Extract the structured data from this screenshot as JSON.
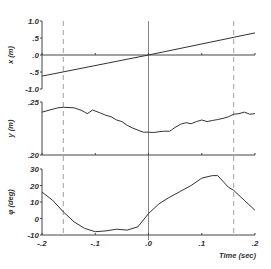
{
  "chart_data": {
    "type": "line",
    "title": "",
    "layout": {
      "panels_stacked_vertically": 3,
      "shared_x_axis": true,
      "grid": false,
      "legend": "none"
    },
    "xlabel": "Time (sec)",
    "xlim": [
      -0.2,
      0.2
    ],
    "x_tick_labels": [
      "-.2",
      "-.1",
      ".0",
      ".1",
      ".2"
    ],
    "x_ticks": [
      -0.2,
      -0.1,
      0.0,
      0.1,
      0.2
    ],
    "reference_lines": {
      "solid_vertical_at": 0.0,
      "dashed_vertical_at": [
        -0.16,
        0.16
      ]
    },
    "panels": [
      {
        "ylabel": "x (m)",
        "ylim": [
          -1.0,
          1.0
        ],
        "y_ticks": [
          1.0,
          0.5,
          0.0,
          -0.5,
          -1.0
        ],
        "y_tick_labels": [
          "1.0",
          ".5",
          ".0",
          "-.5",
          "-1.0"
        ],
        "horizontal_reference_at": 0.0,
        "series": [
          {
            "name": "x",
            "x": [
              -0.2,
              0.0,
              0.2
            ],
            "values": [
              -0.62,
              0.0,
              0.65
            ]
          }
        ]
      },
      {
        "ylabel": "y (m)",
        "ylim": [
          0.2,
          0.25
        ],
        "y_ticks": [
          0.25,
          0.2
        ],
        "y_tick_labels": [
          ".25",
          ".20"
        ],
        "series": [
          {
            "name": "y",
            "x": [
              -0.2,
              -0.17,
              -0.16,
              -0.14,
              -0.125,
              -0.115,
              -0.105,
              -0.09,
              -0.08,
              -0.07,
              -0.06,
              -0.05,
              -0.04,
              -0.03,
              -0.02,
              -0.01,
              0.0,
              0.01,
              0.02,
              0.03,
              0.04,
              0.05,
              0.06,
              0.07,
              0.08,
              0.09,
              0.1,
              0.11,
              0.12,
              0.13,
              0.14,
              0.15,
              0.16,
              0.17,
              0.18,
              0.19,
              0.2
            ],
            "values": [
              0.2405,
              0.2445,
              0.245,
              0.2445,
              0.242,
              0.239,
              0.2425,
              0.2395,
              0.2375,
              0.236,
              0.233,
              0.2315,
              0.228,
              0.2255,
              0.2235,
              0.2215,
              0.2215,
              0.2212,
              0.222,
              0.2225,
              0.2225,
              0.226,
              0.229,
              0.2305,
              0.2295,
              0.2315,
              0.233,
              0.2315,
              0.2325,
              0.2335,
              0.2345,
              0.236,
              0.2385,
              0.239,
              0.2405,
              0.2385,
              0.239
            ]
          }
        ]
      },
      {
        "ylabel": "φ (deg)",
        "ylim": [
          -10,
          30
        ],
        "y_ticks": [
          30,
          20,
          10,
          0,
          -10
        ],
        "y_tick_labels": [
          "30",
          "20",
          "10",
          "0",
          "-10"
        ],
        "series": [
          {
            "name": "phi",
            "x": [
              -0.2,
              -0.18,
              -0.16,
              -0.14,
              -0.12,
              -0.1,
              -0.08,
              -0.06,
              -0.04,
              -0.02,
              0.0,
              0.02,
              0.04,
              0.06,
              0.08,
              0.1,
              0.12,
              0.13,
              0.15,
              0.16,
              0.18,
              0.2
            ],
            "values": [
              16,
              11,
              4,
              -2,
              -6,
              -8,
              -7.5,
              -6.5,
              -7,
              -5,
              3,
              9,
              13,
              16.5,
              20,
              24.5,
              26,
              26,
              19,
              17,
              11,
              5
            ]
          }
        ]
      }
    ]
  }
}
